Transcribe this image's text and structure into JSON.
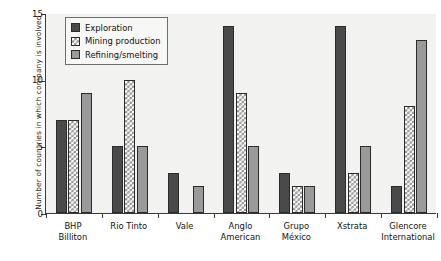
{
  "chart_data": {
    "type": "bar",
    "title": "",
    "xlabel": "",
    "ylabel": "Number of countries in which company is involved",
    "ylim": [
      0,
      15
    ],
    "yticks": [
      0,
      5,
      10,
      15
    ],
    "ytick_labels": [
      "0",
      "5",
      "10",
      "15"
    ],
    "grid": false,
    "legend_position": "upper left inside",
    "categories": [
      "BHP Billiton",
      "Rio Tinto",
      "Vale",
      "Anglo American",
      "Grupo México",
      "Xstrata",
      "Glencore International"
    ],
    "category_lines": [
      [
        "BHP",
        "Billiton"
      ],
      [
        "Rio Tinto",
        ""
      ],
      [
        "Vale",
        ""
      ],
      [
        "Anglo",
        "American"
      ],
      [
        "Grupo",
        "México"
      ],
      [
        "Xstrata",
        ""
      ],
      [
        "Glencore",
        "International"
      ]
    ],
    "series": [
      {
        "name": "Exploration",
        "color": "#4a4a4a",
        "values": [
          7,
          5,
          3,
          14,
          3,
          14,
          2
        ]
      },
      {
        "name": "Mining production",
        "color": "#fbfbfa",
        "values": [
          7,
          10,
          0,
          9,
          2,
          3,
          8
        ]
      },
      {
        "name": "Refining/smelting",
        "color": "#9a9a9a",
        "values": [
          9,
          5,
          2,
          5,
          2,
          5,
          13
        ]
      }
    ]
  },
  "legend": {
    "items": [
      {
        "label": "Exploration",
        "icon": "filled-square-dark-swatch"
      },
      {
        "label": "Mining production",
        "icon": "crosshatch-square-swatch"
      },
      {
        "label": "Refining/smelting",
        "icon": "filled-square-gray-swatch"
      }
    ]
  },
  "colors": {
    "exploration": "#4a4a4a",
    "mining_production": "#fbfbfa",
    "refining_smelting": "#9a9a9a",
    "plot_background": "#f2f2f0",
    "axis": "#3a3a3a",
    "text": "#111111"
  }
}
